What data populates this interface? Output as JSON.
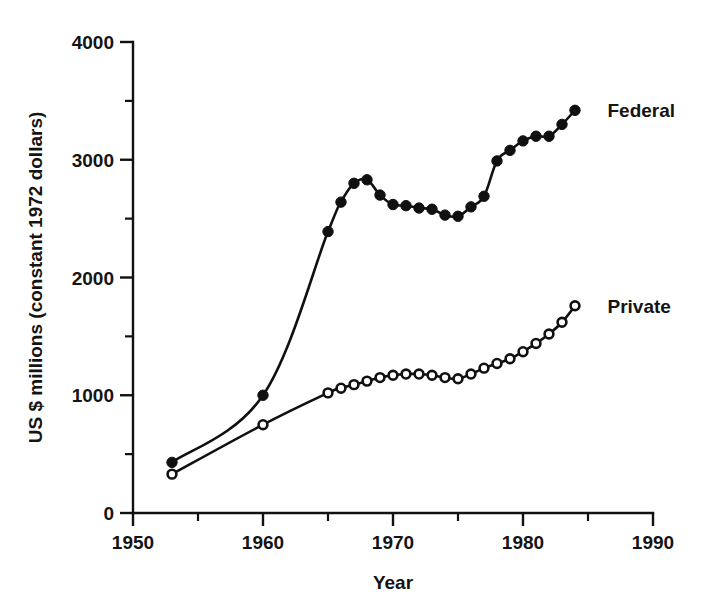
{
  "chart_data": {
    "type": "line",
    "title": "",
    "xlabel": "Year",
    "ylabel": "US $ millions (constant 1972 dollars)",
    "xlim": [
      1950,
      1990
    ],
    "ylim": [
      0,
      4000
    ],
    "x_major_ticks": [
      1950,
      1960,
      1970,
      1980,
      1990
    ],
    "x_minor_ticks": [
      1955,
      1965,
      1975,
      1985
    ],
    "x_tick_labels": [
      "1950",
      "1960",
      "1970",
      "1980",
      "1990"
    ],
    "y_major_ticks": [
      0,
      1000,
      2000,
      3000,
      4000
    ],
    "y_minor_ticks": [
      500,
      1500,
      2500,
      3500
    ],
    "y_tick_labels": [
      "0",
      "1000",
      "2000",
      "3000",
      "4000"
    ],
    "grid": false,
    "legend_position": "inline-right-of-series-end",
    "series": [
      {
        "name": "Federal",
        "marker": "filled-circle",
        "label": "Federal",
        "label_x": 1986.5,
        "label_y": 3420,
        "x": [
          1953,
          1960,
          1965,
          1966,
          1967,
          1968,
          1969,
          1970,
          1971,
          1972,
          1973,
          1974,
          1975,
          1976,
          1977,
          1978,
          1979,
          1980,
          1981,
          1982,
          1983,
          1984
        ],
        "values": [
          430,
          1000,
          2390,
          2640,
          2800,
          2830,
          2700,
          2620,
          2610,
          2590,
          2580,
          2530,
          2520,
          2600,
          2690,
          2990,
          3080,
          3160,
          3200,
          3200,
          3300,
          3420
        ]
      },
      {
        "name": "Private",
        "marker": "open-circle",
        "label": "Private",
        "label_x": 1986.5,
        "label_y": 1760,
        "x": [
          1953,
          1960,
          1965,
          1966,
          1967,
          1968,
          1969,
          1970,
          1971,
          1972,
          1973,
          1974,
          1975,
          1976,
          1977,
          1978,
          1979,
          1980,
          1981,
          1982,
          1983,
          1984
        ],
        "values": [
          330,
          750,
          1020,
          1060,
          1090,
          1120,
          1150,
          1170,
          1180,
          1180,
          1170,
          1150,
          1140,
          1180,
          1230,
          1270,
          1310,
          1370,
          1440,
          1520,
          1620,
          1760
        ]
      }
    ]
  },
  "axis": {
    "x_title": "Year",
    "y_title": "US $ millions (constant 1972 dollars)"
  },
  "labels": {
    "federal": "Federal",
    "private": "Private"
  }
}
